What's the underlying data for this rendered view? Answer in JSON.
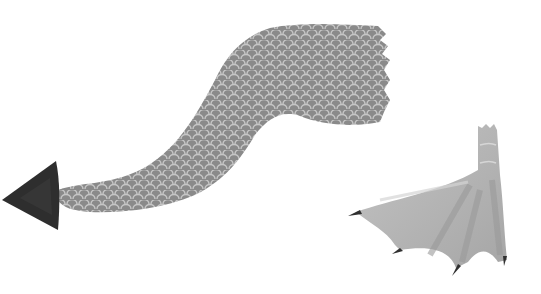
{
  "image": {
    "description": "Grayscale watercolor illustration of a scaled serpent tail with an arrowhead tip and a webbed clawed foot",
    "background": "#ffffff"
  },
  "tail": {
    "fill": "#8a8a8a",
    "scale_stroke": "#c8c8c8",
    "tip_fill": "#2e2e2e"
  },
  "foot": {
    "fill": "#b4b4b4",
    "shade": "#9c9c9c",
    "highlight": "#d2d2d2",
    "claw_fill": "#303030"
  }
}
